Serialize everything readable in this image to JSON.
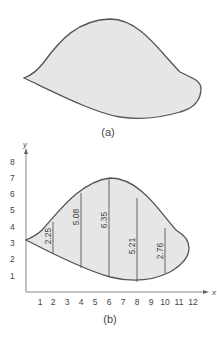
{
  "figure_a": {
    "caption": "(a)"
  },
  "figure_b": {
    "caption": "(b)",
    "x_axis_label": "x",
    "y_axis_label": "y",
    "x_ticks": [
      "1",
      "2",
      "3",
      "4",
      "5",
      "6",
      "7",
      "8",
      "9",
      "10",
      "11",
      "12"
    ],
    "y_ticks": [
      "1",
      "2",
      "3",
      "4",
      "5",
      "6",
      "7",
      "8"
    ],
    "lengths": [
      {
        "x": 2,
        "label": "2.25"
      },
      {
        "x": 4,
        "label": "5.08"
      },
      {
        "x": 6,
        "label": "6.35"
      },
      {
        "x": 8,
        "label": "5.21"
      },
      {
        "x": 10,
        "label": "2.76"
      }
    ]
  },
  "colors": {
    "fill": "#e6e6e6",
    "stroke": "#555555"
  }
}
